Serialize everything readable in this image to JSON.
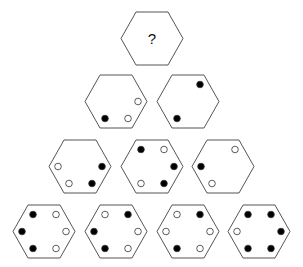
{
  "puzzle": {
    "question_mark": "?",
    "stroke_color": "#555555",
    "dot_black": "#000000",
    "dot_white": "#ffffff",
    "slots": [
      "TL",
      "TR",
      "L",
      "R",
      "BL",
      "BR"
    ],
    "rows": [
      {
        "row": 1,
        "hexagons": [
          {
            "id": "apex",
            "center": [
              152,
              38
            ],
            "question": true,
            "dots": {}
          }
        ]
      },
      {
        "row": 2,
        "hexagons": [
          {
            "id": "r2-1",
            "center": [
              116,
              101
            ],
            "dots": {
              "R": "white",
              "BL": "black",
              "BR": "white"
            }
          },
          {
            "id": "r2-2",
            "center": [
              188,
              101
            ],
            "dots": {
              "TR": "black",
              "BL": "black"
            }
          }
        ]
      },
      {
        "row": 3,
        "hexagons": [
          {
            "id": "r3-1",
            "center": [
              80,
              166
            ],
            "dots": {
              "L": "white",
              "R": "black",
              "BL": "white",
              "BR": "black"
            }
          },
          {
            "id": "r3-2",
            "center": [
              152,
              166
            ],
            "dots": {
              "TL": "black",
              "TR": "white",
              "R": "black",
              "BL": "white",
              "BR": "black"
            }
          },
          {
            "id": "r3-3",
            "center": [
              223,
              166
            ],
            "dots": {
              "TR": "white",
              "L": "black",
              "BL": "white"
            }
          }
        ]
      },
      {
        "row": 4,
        "hexagons": [
          {
            "id": "r4-1",
            "center": [
              44,
              231
            ],
            "dots": {
              "TL": "black",
              "TR": "white",
              "L": "black",
              "R": "white",
              "BL": "black",
              "BR": "white"
            }
          },
          {
            "id": "r4-2",
            "center": [
              116,
              231
            ],
            "dots": {
              "TL": "white",
              "TR": "black",
              "L": "black",
              "R": "white",
              "BL": "black",
              "BR": "white"
            }
          },
          {
            "id": "r4-3",
            "center": [
              188,
              231
            ],
            "dots": {
              "TL": "white",
              "TR": "black",
              "L": "white",
              "R": "white",
              "BL": "black",
              "BR": "white"
            }
          },
          {
            "id": "r4-4",
            "center": [
              259,
              231
            ],
            "dots": {
              "TL": "black",
              "TR": "black",
              "L": "white",
              "R": "black",
              "BL": "black",
              "BR": "black"
            }
          }
        ]
      }
    ]
  }
}
